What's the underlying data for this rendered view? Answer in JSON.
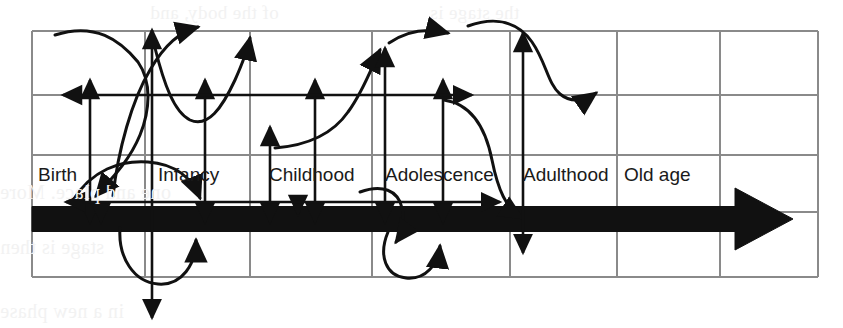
{
  "figure": {
    "kind": "scanned-book-diagram",
    "width": 843,
    "height": 328,
    "background_color": "#ffffff",
    "ink_color": "#111111",
    "grid_color": "#8a8a8a",
    "bleed_color": "#f2f2f2"
  },
  "stages": [
    {
      "label": "Birth",
      "x": 38,
      "y": 181
    },
    {
      "label": "Infancy",
      "x": 158,
      "y": 181
    },
    {
      "label": "Childhood",
      "x": 269,
      "y": 181
    },
    {
      "label": "Adolescence",
      "x": 385,
      "y": 181
    },
    {
      "label": "Adulthood",
      "x": 523,
      "y": 181
    },
    {
      "label": "Old age",
      "x": 624,
      "y": 181
    }
  ],
  "grid": {
    "vertical_x": [
      32,
      145,
      250,
      372,
      510,
      617,
      720,
      818
    ],
    "horizontal_y": [
      31,
      95,
      155,
      212,
      277
    ],
    "left": 32,
    "right": 818,
    "top": 31,
    "bottom": 277
  },
  "timeline_arrow": {
    "name": "main-time-arrow",
    "direction": "right",
    "x_start": 32,
    "x_end": 793,
    "y_center": 219,
    "thickness": 25,
    "head_length": 58,
    "head_half_height": 31,
    "color": "#111111"
  },
  "straight_arrows": [
    {
      "name": "vertical-double-arrow-birth",
      "orientation": "vertical",
      "x": 90,
      "y1": 80,
      "y2": 222,
      "heads": "both"
    },
    {
      "name": "vertical-double-arrow-birth-outer",
      "orientation": "vertical",
      "x": 101,
      "y1": 208,
      "y2": 222,
      "heads": "end"
    },
    {
      "name": "vertical-long-arrow-infancy-down",
      "orientation": "vertical",
      "x": 152,
      "y1": 30,
      "y2": 318,
      "heads": "both"
    },
    {
      "name": "vertical-double-arrow-infancy",
      "orientation": "vertical",
      "x": 205,
      "y1": 80,
      "y2": 222,
      "heads": "both"
    },
    {
      "name": "vertical-double-arrow-childhood-a",
      "orientation": "vertical",
      "x": 270,
      "y1": 127,
      "y2": 222,
      "heads": "both"
    },
    {
      "name": "vertical-double-arrow-childhood-b",
      "orientation": "vertical",
      "x": 315,
      "y1": 80,
      "y2": 222,
      "heads": "both"
    },
    {
      "name": "vertical-arrow-childhood-up",
      "orientation": "vertical",
      "x": 298,
      "y1": 214,
      "y2": 206,
      "heads": "start"
    },
    {
      "name": "vertical-double-arrow-adolescence",
      "orientation": "vertical",
      "x": 385,
      "y1": 48,
      "y2": 222,
      "heads": "both"
    },
    {
      "name": "vertical-double-arrow-adulthood-a",
      "orientation": "vertical",
      "x": 443,
      "y1": 80,
      "y2": 222,
      "heads": "both"
    },
    {
      "name": "vertical-double-arrow-adulthood-b",
      "orientation": "vertical",
      "x": 523,
      "y1": 33,
      "y2": 253,
      "heads": "both"
    },
    {
      "name": "horizontal-double-arrow-upper",
      "orientation": "horizontal",
      "y": 95,
      "x1": 63,
      "x2": 472,
      "heads": "both"
    },
    {
      "name": "horizontal-double-arrow-lower",
      "orientation": "horizontal",
      "y": 202,
      "x1": 66,
      "x2": 500,
      "heads": "both"
    }
  ],
  "curves": [
    {
      "name": "curve-birth-s-rise",
      "d": "M 55 35 C 95 22 120 40 138 62 C 152 82 150 110 140 135 C 128 164 108 182 96 196"
    },
    {
      "name": "curve-birth-s-descend",
      "d": "M 113 196 C 118 150 132 100 150 70 C 165 44 180 32 198 27"
    },
    {
      "name": "curve-infancy-u",
      "d": "M 155 48 C 164 84 174 112 190 120 C 208 128 222 108 235 80 C 243 62 248 48 250 38"
    },
    {
      "name": "curve-infancy-hump",
      "d": "M 73 200 C 92 170 120 160 148 162 C 175 164 192 178 200 198"
    },
    {
      "name": "curve-infancy-loop-under",
      "d": "M 120 228 C 118 258 134 282 158 284 C 182 286 196 264 196 240"
    },
    {
      "name": "curve-childhood-s-up",
      "d": "M 275 148 C 300 146 330 138 348 112 C 364 90 372 66 380 50"
    },
    {
      "name": "curve-adolescence-out",
      "d": "M 389 43 C 408 30 428 28 448 33"
    },
    {
      "name": "curve-adulthood-descend",
      "d": "M 444 100 C 472 104 486 130 492 160 C 498 190 506 208 522 218"
    },
    {
      "name": "curve-oldage-s",
      "d": "M 468 26 C 496 16 518 22 532 42 C 546 62 548 84 560 94 C 572 104 586 100 596 93"
    },
    {
      "name": "curve-adolescence-hook",
      "d": "M 360 192 C 382 184 398 190 402 208 C 405 222 402 234 396 242"
    },
    {
      "name": "curve-adolescence-loop",
      "d": "M 388 232 C 378 256 386 276 406 278 C 426 280 438 264 440 246"
    }
  ],
  "bleed_text": [
    {
      "text": "of the body, and",
      "x": 150,
      "y": 2,
      "size": 19
    },
    {
      "text": "the stage is",
      "x": 430,
      "y": 2,
      "size": 19
    },
    {
      "text": "one and place. More",
      "x": 0,
      "y": 181,
      "size": 20
    },
    {
      "text": "stage is then",
      "x": 0,
      "y": 236,
      "size": 20
    },
    {
      "text": "in a new phase",
      "x": 0,
      "y": 300,
      "size": 20
    }
  ]
}
